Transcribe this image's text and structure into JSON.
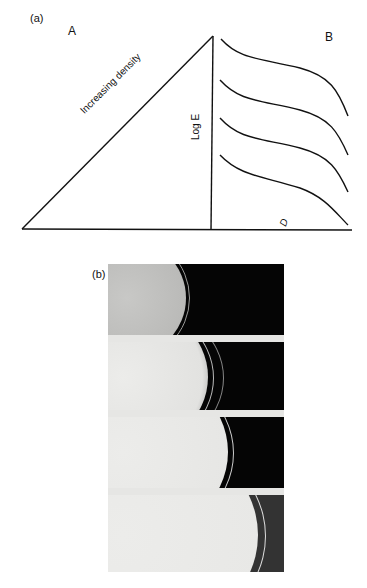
{
  "panel_a": {
    "label": "(a)",
    "part_a_label": "A",
    "part_b_label": "B",
    "hypotenuse_label": "Increasing density",
    "vertical_axis_label": "Log E",
    "horizontal_axis_label": "D",
    "curve_count": 4
  },
  "panel_b": {
    "label": "(b)",
    "frame_count": 4
  }
}
